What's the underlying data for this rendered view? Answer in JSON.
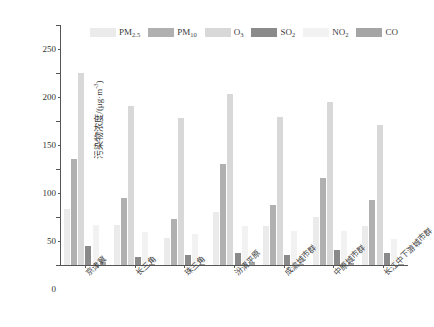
{
  "chart_data": {
    "type": "bar",
    "title": "",
    "subtitle": "",
    "xlabel": "",
    "ylabel": "污染物浓度/(μg·m-3)",
    "ylabel_base": "污染物浓度/(μg·m",
    "ylabel_sup": "-3",
    "ylabel_tail": ")",
    "ylim": [
      0,
      250
    ],
    "ytick_step": 50,
    "yminor_step": 25,
    "grid": false,
    "legend_position": "top-center",
    "bar_orientation": "vertical",
    "categories": [
      "京津冀",
      "长三角",
      "珠三角",
      "汾渭平原",
      "成渝城市群",
      "中原城市群",
      "长江中下游城市群"
    ],
    "ytick_labels": [
      "0",
      "50",
      "100",
      "150",
      "200",
      "250"
    ],
    "ytick_values": [
      0,
      50,
      100,
      150,
      200,
      250
    ],
    "series": [
      {
        "name": "PM2.5",
        "label_base": "PM",
        "label_sub": "2.5",
        "color": "#ebebeb",
        "values": [
          58,
          42,
          28,
          55,
          41,
          50,
          41
        ]
      },
      {
        "name": "PM10",
        "label_base": "PM",
        "label_sub": "10",
        "color": "#b0b0b0",
        "values": [
          110,
          70,
          48,
          105,
          62,
          91,
          68
        ]
      },
      {
        "name": "O3",
        "label_base": "O",
        "label_sub": "3",
        "color": "#d8d8d8",
        "values": [
          200,
          166,
          153,
          178,
          154,
          170,
          146
        ]
      },
      {
        "name": "SO2",
        "label_base": "SO",
        "label_sub": "2",
        "color": "#8a8a8a",
        "values": [
          20,
          8,
          10,
          13,
          10,
          16,
          12
        ]
      },
      {
        "name": "NO2",
        "label_base": "NO",
        "label_sub": "2",
        "color": "#f2f2f2",
        "values": [
          42,
          34,
          32,
          41,
          35,
          35,
          27
        ]
      },
      {
        "name": "CO",
        "label_base": "CO",
        "label_sub": "",
        "color": "#a5a5a5",
        "values": [
          3,
          1,
          1,
          3,
          1,
          2,
          1
        ]
      }
    ]
  },
  "axis": {
    "frame_color": "#555555",
    "text_color": "#333333"
  }
}
